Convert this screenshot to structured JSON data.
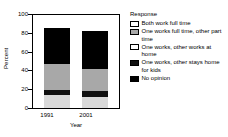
{
  "chart_data": {
    "type": "bar",
    "stacked": true,
    "title": "",
    "xlabel": "Year",
    "ylabel": "Percent",
    "categories": [
      "1991",
      "2001"
    ],
    "ylim": [
      0,
      100
    ],
    "yticks": [
      0,
      20,
      40,
      60,
      80,
      100
    ],
    "ytick_labels": [
      "0",
      "20",
      "40",
      "60",
      "80",
      "100"
    ],
    "grid": false,
    "legend_position": "right",
    "legend_title": "Response",
    "series": [
      {
        "name": "No opinion",
        "color": "#d9d9d9",
        "values": [
          14,
          12
        ]
      },
      {
        "name": "One works, other stays home for kids",
        "color": "#111111",
        "values": [
          5,
          6
        ]
      },
      {
        "name": "One works, other works at home",
        "color": "#a8a8a8",
        "values": [
          28,
          24
        ]
      },
      {
        "name": "One works full time, other part time",
        "color": "#000000",
        "values": [
          39,
          41
        ]
      },
      {
        "name": "Both work full time",
        "color": "#ffffff",
        "values": [
          14,
          17
        ]
      }
    ],
    "stack_order_bottom_to_top": [
      "No opinion",
      "One works, other stays home for kids",
      "One works, other works at home",
      "One works full time, other part time",
      "Both work full time"
    ]
  },
  "legend": {
    "title": "Response",
    "items": [
      {
        "label": "Both work full time",
        "color": "#ffffff",
        "icon": "legend-swatch-white"
      },
      {
        "label": "One works full time, other part time",
        "color": "#a8a8a8",
        "icon": "legend-swatch-gray"
      },
      {
        "label": "One works, other works at home",
        "color": "#ffffff",
        "icon": "legend-swatch-white"
      },
      {
        "label": "One works, other stays home for kids",
        "color": "#111111",
        "icon": "legend-swatch-black"
      },
      {
        "label": "No opinion",
        "color": "#000000",
        "icon": "legend-swatch-black"
      }
    ]
  },
  "axes": {
    "y_title": "Percent",
    "x_title": "Year",
    "y_ticks": [
      "100",
      "80",
      "60",
      "40",
      "20",
      "0"
    ],
    "x_ticks": [
      "1991",
      "2001"
    ]
  }
}
